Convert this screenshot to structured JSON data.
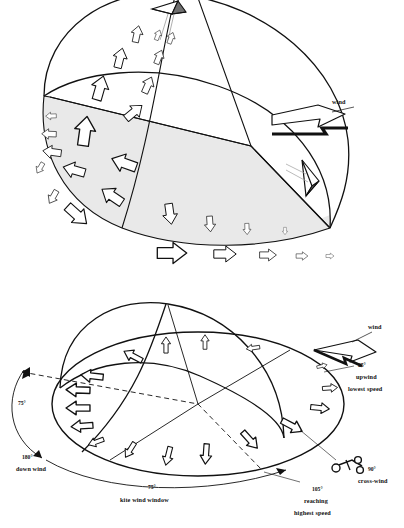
{
  "figure": {
    "ink_color": "#000000",
    "shade_color": "#e9e9e9",
    "background": "#ffffff"
  },
  "top_diagram": {
    "name": "wind-window-hemisphere-perspective",
    "description": "Hemispherical wind window dome with shaded ground sector and outlined airflow arrows",
    "wind_label": "wind",
    "icons": [
      "kite-apex-icon",
      "kite-edge-icon",
      "wind-arrow-icon"
    ],
    "arrow_gradient": {
      "description": "Row of arrows decreasing in size showing decreasing wind speed",
      "count": 5,
      "scales": [
        1.0,
        0.78,
        0.58,
        0.4,
        0.27
      ]
    }
  },
  "bottom_diagram": {
    "name": "wind-window-plan-with-angles",
    "description": "Dome over ground ellipse annotated with wind window angles",
    "wind_label": "wind",
    "annotations": [
      {
        "key": "upwind",
        "angle": "25°",
        "line1": "upwind",
        "line2": "lowest speed"
      },
      {
        "key": "crosswind",
        "angle": "90°",
        "line1": "cross-wind",
        "line2": ""
      },
      {
        "key": "reaching",
        "angle": "105°",
        "line1": "reaching",
        "line2": "highest speed"
      },
      {
        "key": "downwind",
        "angle": "180°",
        "line1": "down wind",
        "line2": ""
      },
      {
        "key": "window",
        "angle": "75°",
        "line1": "kite wind window",
        "line2": ""
      },
      {
        "key": "left-arc",
        "angle": "75°",
        "line1": "",
        "line2": ""
      }
    ],
    "icons": [
      "kite-buggy-icon",
      "wind-arrow-icon"
    ]
  }
}
